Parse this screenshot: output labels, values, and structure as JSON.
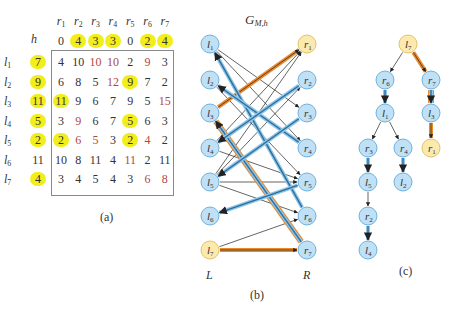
{
  "panel_a": {
    "caption": "(a)",
    "h_label": "h",
    "columns": [
      "r1",
      "r2",
      "r3",
      "r4",
      "r5",
      "r6",
      "r7"
    ],
    "h_right": [
      {
        "v": "0",
        "hl": false
      },
      {
        "v": "4",
        "hl": true
      },
      {
        "v": "3",
        "hl": true
      },
      {
        "v": "3",
        "hl": true
      },
      {
        "v": "0",
        "hl": false
      },
      {
        "v": "2",
        "hl": true
      },
      {
        "v": "4",
        "hl": true
      }
    ],
    "rows": [
      {
        "label": "l1",
        "h": "7",
        "hl": true,
        "cells": [
          {
            "v": "4"
          },
          {
            "v": "10"
          },
          {
            "v": "10",
            "red": true
          },
          {
            "v": "10",
            "red": true
          },
          {
            "v": "2"
          },
          {
            "v": "9",
            "red": true
          },
          {
            "v": "3"
          }
        ]
      },
      {
        "label": "l2",
        "h": "9",
        "hl": true,
        "cells": [
          {
            "v": "6"
          },
          {
            "v": "8"
          },
          {
            "v": "5"
          },
          {
            "v": "12",
            "red": true
          },
          {
            "v": "9",
            "hl": true
          },
          {
            "v": "7"
          },
          {
            "v": "2"
          }
        ]
      },
      {
        "label": "l3",
        "h": "11",
        "hl": true,
        "cells": [
          {
            "v": "11",
            "hl": true
          },
          {
            "v": "9"
          },
          {
            "v": "6"
          },
          {
            "v": "7"
          },
          {
            "v": "9"
          },
          {
            "v": "5"
          },
          {
            "v": "15",
            "red": true
          }
        ]
      },
      {
        "label": "l4",
        "h": "5",
        "hl": true,
        "cells": [
          {
            "v": "3"
          },
          {
            "v": "9",
            "red": true
          },
          {
            "v": "6"
          },
          {
            "v": "7"
          },
          {
            "v": "5",
            "hl": true
          },
          {
            "v": "6"
          },
          {
            "v": "3"
          }
        ]
      },
      {
        "label": "l5",
        "h": "2",
        "hl": true,
        "cells": [
          {
            "v": "2",
            "hl": true
          },
          {
            "v": "6",
            "red": true
          },
          {
            "v": "5",
            "red": true
          },
          {
            "v": "3"
          },
          {
            "v": "2",
            "hl": true
          },
          {
            "v": "4",
            "red": true
          },
          {
            "v": "2"
          }
        ]
      },
      {
        "label": "l6",
        "h": "11",
        "hl": false,
        "cells": [
          {
            "v": "10"
          },
          {
            "v": "8"
          },
          {
            "v": "11"
          },
          {
            "v": "4"
          },
          {
            "v": "11",
            "red": true
          },
          {
            "v": "2"
          },
          {
            "v": "11"
          }
        ]
      },
      {
        "label": "l7",
        "h": "4",
        "hl": true,
        "cells": [
          {
            "v": "3"
          },
          {
            "v": "4"
          },
          {
            "v": "5"
          },
          {
            "v": "4"
          },
          {
            "v": "3"
          },
          {
            "v": "6",
            "red": true
          },
          {
            "v": "8",
            "red": true
          }
        ]
      }
    ]
  },
  "panel_b": {
    "title": "G",
    "title_sub": "M,h",
    "caption": "(b)",
    "left_label": "L",
    "right_label": "R",
    "left_nodes": [
      "l1",
      "l2",
      "l3",
      "l4",
      "l5",
      "l6",
      "l7"
    ],
    "right_nodes": [
      "r1",
      "r2",
      "r3",
      "r4",
      "r5",
      "r6",
      "r7"
    ],
    "free_nodes": [
      "l7",
      "r1"
    ],
    "matched_edges": [
      [
        "r6",
        "l1"
      ],
      [
        "r4",
        "l2"
      ],
      [
        "r7",
        "l3"
      ],
      [
        "r2",
        "l4"
      ],
      [
        "r3",
        "l5"
      ],
      [
        "r5",
        "l6"
      ]
    ],
    "tight_edges": [
      [
        "l1",
        "r3"
      ],
      [
        "l1",
        "r4"
      ],
      [
        "l2",
        "r5"
      ],
      [
        "l3",
        "r1"
      ],
      [
        "l4",
        "r5"
      ],
      [
        "l5",
        "r1"
      ],
      [
        "l5",
        "r2"
      ],
      [
        "l5",
        "r5"
      ],
      [
        "l5",
        "r6"
      ],
      [
        "l7",
        "r6"
      ],
      [
        "l7",
        "r7"
      ],
      [
        "l4",
        "r1"
      ]
    ],
    "augmenting_path": [
      "l7",
      "r7",
      "l3",
      "r1"
    ],
    "colors": {
      "node_fill": "#bfe0f5",
      "node_stroke": "#6fb2dd",
      "free_fill": "#fbe9ae",
      "free_stroke": "#e2c36a",
      "matched": "#2f6d99",
      "matched_glow": "#8cc6ea",
      "path": "#e8892b"
    }
  },
  "panel_c": {
    "caption": "(c)",
    "root": "l7",
    "tree_edges": [
      [
        "l7",
        "r6"
      ],
      [
        "l7",
        "r7"
      ],
      [
        "r6",
        "l1"
      ],
      [
        "l1",
        "r3"
      ],
      [
        "l1",
        "r4"
      ],
      [
        "r3",
        "l5"
      ],
      [
        "r4",
        "l2"
      ],
      [
        "l5",
        "r2"
      ],
      [
        "r2",
        "l4"
      ],
      [
        "r7",
        "l3"
      ],
      [
        "l3",
        "r1"
      ]
    ]
  }
}
